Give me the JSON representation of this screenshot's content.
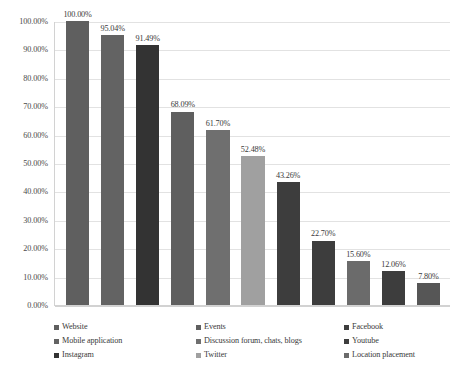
{
  "chart_data": {
    "type": "bar",
    "title": "",
    "subtitle": "",
    "xlabel": "",
    "ylabel": "",
    "ylim": [
      0,
      100
    ],
    "grid": true,
    "legend_position": "bottom",
    "value_suffix": "%",
    "categories": [
      "Website",
      "Mobile application",
      "Instagram",
      "Events",
      "Discussion forum, chats, blogs",
      "Twitter",
      "Facebook",
      "Youtube",
      "Location placement",
      "Youtube",
      "Location placement"
    ],
    "values": [
      100.0,
      95.04,
      91.49,
      68.09,
      61.7,
      52.48,
      43.26,
      22.7,
      15.6,
      12.06,
      7.8
    ],
    "value_labels": [
      "100.00%",
      "95.04%",
      "91.49%",
      "68.09%",
      "61.70%",
      "52.48%",
      "43.26%",
      "22.70%",
      "15.60%",
      "12.06%",
      "7.80%"
    ],
    "bar_colors": [
      "#5f5f5f",
      "#636363",
      "#333333",
      "#5f5f5f",
      "#6f6f6f",
      "#a0a0a0",
      "#3d3d3d",
      "#3d3d3d",
      "#6b6b6b",
      "#3d3d3d",
      "#565656"
    ],
    "y_ticks": [
      "0.00%",
      "10.00%",
      "20.00%",
      "30.00%",
      "40.00%",
      "50.00%",
      "60.00%",
      "70.00%",
      "80.00%",
      "90.00%",
      "100.00%"
    ],
    "y_tick_values": [
      0,
      10,
      20,
      30,
      40,
      50,
      60,
      70,
      80,
      90,
      100
    ],
    "legend": [
      {
        "label": "Website",
        "color": "#5f5f5f"
      },
      {
        "label": "Mobile application",
        "color": "#636363"
      },
      {
        "label": "Instagram",
        "color": "#333333"
      },
      {
        "label": "Events",
        "color": "#5f5f5f"
      },
      {
        "label": "Discussion forum, chats, blogs",
        "color": "#6f6f6f"
      },
      {
        "label": "Twitter",
        "color": "#a0a0a0"
      },
      {
        "label": "Facebook",
        "color": "#3d3d3d"
      },
      {
        "label": "Youtube",
        "color": "#3d3d3d"
      },
      {
        "label": "Location placement",
        "color": "#6b6b6b"
      }
    ],
    "colors": {
      "gridline": "#e2e2e2",
      "axis": "#d2d2d2",
      "text": "#3a3a3a",
      "background": "#ffffff"
    }
  }
}
